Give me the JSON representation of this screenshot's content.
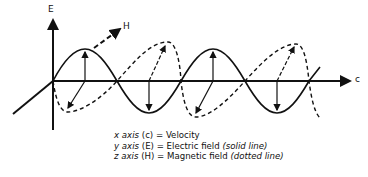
{
  "labels": {
    "e_axis": "E",
    "h_axis": "H",
    "c_axis": "c"
  },
  "legend": [
    {
      "axis": "x axis",
      "symbol": "(c)",
      "eq": "= Velocity",
      "note": ""
    },
    {
      "axis": "y axis",
      "symbol": "(E)",
      "eq": "= Electric field",
      "note": "(solid line)"
    },
    {
      "axis": "z axis",
      "symbol": "(H)",
      "eq": "= Magnetic field",
      "note": "(dotted line)"
    }
  ],
  "colors": {
    "line": "#111111",
    "background": "#ffffff"
  }
}
